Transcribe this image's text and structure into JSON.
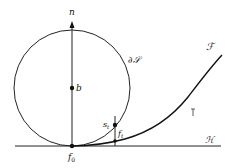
{
  "diagram": {
    "labels": {
      "normal": "n",
      "center": "b",
      "boundary": "∂𝒮",
      "curve": "ℱ",
      "plane": "ℋ",
      "origin": "f",
      "origin_sub": "0",
      "circle_point": "s",
      "circle_point_sub": "t",
      "curve_point": "f",
      "curve_point_sub": "t"
    },
    "colors": {
      "stroke": "#111111",
      "background": "#ffffff"
    }
  }
}
